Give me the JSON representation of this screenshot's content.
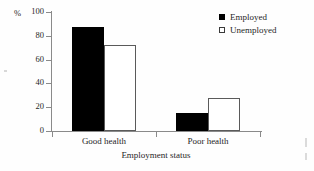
{
  "chart_data": {
    "type": "bar",
    "title": "",
    "xlabel": "Employment status",
    "ylabel": "%",
    "categories": [
      "Good health",
      "Poor health"
    ],
    "series": [
      {
        "name": "Employed",
        "values": [
          87,
          15
        ],
        "style": "filled",
        "color": "#000000"
      },
      {
        "name": "Unemployed",
        "values": [
          72,
          28
        ],
        "style": "hollow",
        "color": "#ffffff"
      }
    ],
    "ylim": [
      0,
      100
    ],
    "yticks": [
      0,
      20,
      40,
      60,
      80,
      100
    ],
    "ytick_labels": [
      "0",
      "20",
      "40",
      "60",
      "80",
      "100"
    ],
    "grid": false,
    "legend_position": "top-right"
  },
  "axes": {
    "y_unit_label": "%",
    "x_title": "Employment status",
    "axis_color": "#8a8a8a"
  },
  "legend": {
    "items": [
      {
        "label": "Employed",
        "swatch": "filled-square-icon"
      },
      {
        "label": "Unemployed",
        "swatch": "hollow-square-icon"
      }
    ]
  }
}
